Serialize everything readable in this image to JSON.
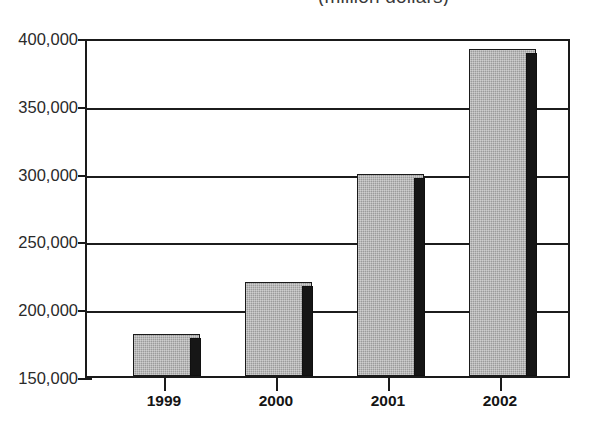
{
  "chart_title": "(million dollars)",
  "chart_data": {
    "type": "bar",
    "title": "(million dollars)",
    "subtitle": "",
    "xlabel": "",
    "ylabel": "",
    "categories": [
      "1999",
      "2000",
      "2001",
      "2002"
    ],
    "values": [
      181000,
      220000,
      301000,
      394000
    ],
    "ylim": [
      150000,
      400000
    ],
    "ytick_values": [
      400000,
      350000,
      300000,
      250000,
      200000,
      150000
    ],
    "ytick_labels": [
      "400,000",
      "350,000",
      "300,000",
      "250,000",
      "200,000",
      "150,000"
    ],
    "grid": true,
    "legend": false,
    "legend_position": "none",
    "series": [
      {
        "name": "",
        "values": [
          181000,
          220000,
          301000,
          394000
        ]
      }
    ],
    "annotations": [],
    "colors": {
      "bar_face": "#9b9b9b",
      "bar_side": "#161616",
      "axis": "#1a1a1a",
      "grid": "#1c1c1c",
      "text": "#1c1c1c",
      "background": "#ffffff"
    }
  }
}
